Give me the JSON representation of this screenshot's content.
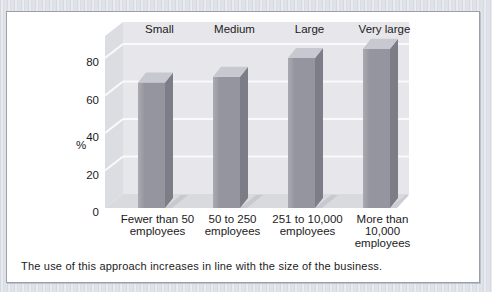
{
  "page": {
    "background": "#dfe2e8"
  },
  "figure": {
    "background": "#ffffff",
    "border_color": "#98a1ab"
  },
  "chart_data": {
    "type": "bar",
    "style": "3d-column",
    "title": "",
    "size_labels": [
      "Small",
      "Medium",
      "Large",
      "Very large"
    ],
    "categories": [
      [
        "Fewer than 50",
        "employees"
      ],
      [
        "50 to 250",
        "employees"
      ],
      [
        "251 to 10,000",
        "employees"
      ],
      [
        "More than",
        "10,000",
        "employees"
      ]
    ],
    "values": [
      67,
      70,
      80,
      85
    ],
    "ylabel": "%",
    "yticks": [
      0,
      20,
      40,
      60,
      80
    ],
    "ylim": [
      0,
      92
    ],
    "grid": true,
    "legend": null,
    "caption": "The use of this approach increases in line with the size of the business.",
    "colors": {
      "bar_front": "#94959e",
      "bar_front_light": "#aaabb2",
      "bar_side": "#7c7d86",
      "bar_top": "#c8c9d0",
      "wall": "#e7e7eb",
      "wall_left": "#dcdde2",
      "floor": "#d9dade",
      "shadow": "#c4c5cb",
      "gridline": "#fafafa",
      "text": "#1b1b1b"
    }
  }
}
